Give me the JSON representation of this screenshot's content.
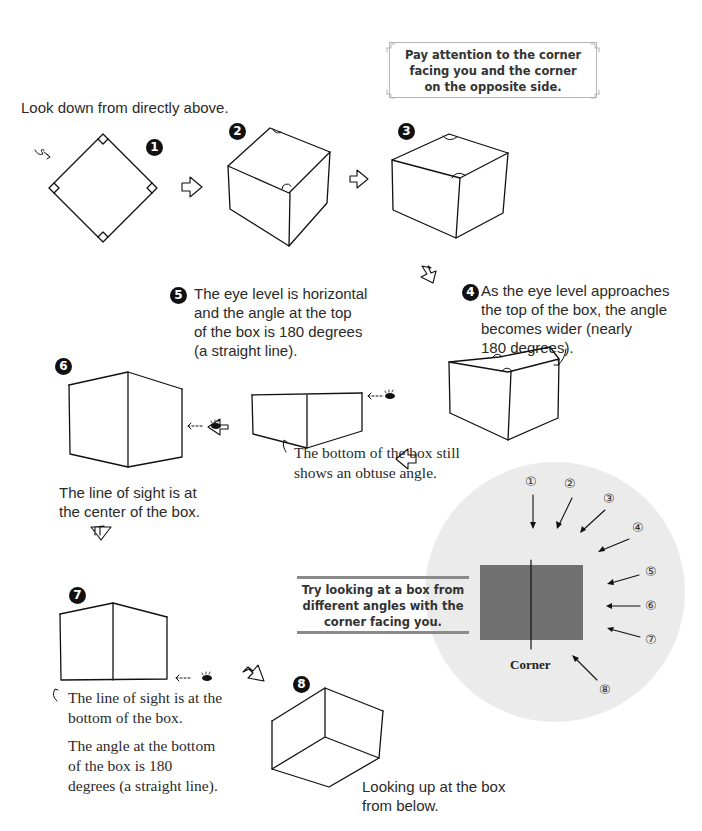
{
  "callout_top": {
    "lines": [
      "Pay attention to the corner",
      "facing you and the corner",
      "on the opposite side."
    ]
  },
  "steps": [
    {
      "number": "1",
      "caption": "Look down from directly above."
    },
    {
      "number": "2",
      "caption": ""
    },
    {
      "number": "3",
      "caption": ""
    },
    {
      "number": "4",
      "caption_lines": [
        "As the eye level approaches",
        "the top of the box, the angle",
        "becomes wider (nearly",
        "180 degrees)."
      ]
    },
    {
      "number": "5",
      "caption_lines": [
        "The eye level is horizontal",
        "and the angle at the top",
        "of the box is 180 degrees",
        "(a straight line)."
      ],
      "note_lines": [
        "The bottom of the box still",
        "shows an obtuse angle."
      ]
    },
    {
      "number": "6",
      "caption_lines": [
        "The line of sight is at",
        "the center of the box."
      ]
    },
    {
      "number": "7",
      "caption_lines": [
        "The line of sight is at the",
        "bottom of the box."
      ],
      "note_lines": [
        "The angle at the bottom",
        "of the box is 180",
        "degrees (a straight line)."
      ]
    },
    {
      "number": "8",
      "caption_lines": [
        "Looking up at the box",
        "from below."
      ]
    }
  ],
  "tip_box": {
    "lines": [
      "Try looking at a box from",
      "different angles with the",
      "corner facing you."
    ]
  },
  "angle_diagram": {
    "corner_label": "Corner",
    "viewpoints": [
      "①",
      "②",
      "③",
      "④",
      "⑤",
      "⑥",
      "⑦",
      "⑧"
    ],
    "colors": {
      "circle": "#ebebeb",
      "box": "#707070",
      "line": "#111111"
    }
  }
}
